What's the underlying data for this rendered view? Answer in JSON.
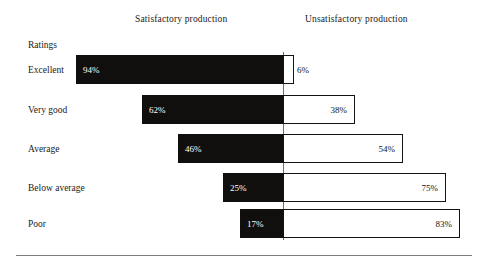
{
  "headers": {
    "left": "Satisfactory production",
    "right": "Unsatisfactory production"
  },
  "axis_caption": "Ratings",
  "chart_data": {
    "type": "bar",
    "subtype": "diverging-stacked-bar",
    "title": "",
    "xlabel": "",
    "ylabel": "Ratings",
    "categories": [
      "Excellent",
      "Very good",
      "Average",
      "Below average",
      "Poor"
    ],
    "series": [
      {
        "name": "Satisfactory production",
        "values": [
          94,
          62,
          46,
          25,
          17
        ],
        "labels": [
          "94%",
          "62%",
          "46%",
          "25%",
          "17%"
        ],
        "color": "#100f0d"
      },
      {
        "name": "Unsatisfactory production",
        "values": [
          6,
          38,
          54,
          75,
          83
        ],
        "labels": [
          "6%",
          "38%",
          "54%",
          "75%",
          "83%"
        ],
        "color": "#ffffff"
      }
    ],
    "unit": "%",
    "xlim": [
      0,
      100
    ],
    "grid": false,
    "legend": "top"
  },
  "rows": [
    {
      "label": "Excellent",
      "left_value": "94%",
      "right_value": "6%",
      "left_px": 207,
      "right_px": 11,
      "top_px": 55,
      "value_outside": true
    },
    {
      "label": "Very good",
      "left_value": "62%",
      "right_value": "38%",
      "left_px": 141,
      "right_px": 72,
      "top_px": 95,
      "value_outside": false
    },
    {
      "label": "Average",
      "left_value": "46%",
      "right_value": "54%",
      "left_px": 105,
      "right_px": 120,
      "top_px": 134,
      "value_outside": false
    },
    {
      "label": "Below average",
      "left_value": "25%",
      "right_value": "75%",
      "left_px": 60,
      "right_px": 163,
      "top_px": 173,
      "value_outside": false
    },
    {
      "label": "Poor",
      "left_value": "17%",
      "right_value": "83%",
      "left_px": 43,
      "right_px": 177,
      "top_px": 209,
      "value_outside": false
    }
  ]
}
